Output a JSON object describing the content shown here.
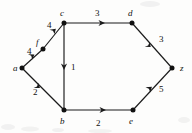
{
  "figure": {
    "kind": "directed-weighted-graph",
    "background_color": "#fdfdfc",
    "ink_color": "#1a1a1a"
  },
  "nodes": [
    {
      "id": "a",
      "label": "a",
      "x": 22,
      "y": 68,
      "label_x": 13,
      "label_y": 71
    },
    {
      "id": "f",
      "label": "f",
      "x": 43,
      "y": 49,
      "label_x": 36,
      "label_y": 45
    },
    {
      "id": "c",
      "label": "c",
      "x": 64,
      "y": 23,
      "label_x": 60,
      "label_y": 16
    },
    {
      "id": "b",
      "label": "b",
      "x": 64,
      "y": 110,
      "label_x": 60,
      "label_y": 124
    },
    {
      "id": "d",
      "label": "d",
      "x": 132,
      "y": 23,
      "label_x": 128,
      "label_y": 16
    },
    {
      "id": "e",
      "label": "e",
      "x": 133,
      "y": 110,
      "label_x": 129,
      "label_y": 124
    },
    {
      "id": "z",
      "label": "z",
      "x": 172,
      "y": 68,
      "label_x": 180,
      "label_y": 71
    }
  ],
  "edges": [
    {
      "id": "a-f",
      "from": "a",
      "to": "f",
      "weight": "4",
      "label_x": 27,
      "label_y": 54
    },
    {
      "id": "f-c",
      "from": "f",
      "to": "c",
      "weight": "4",
      "label_x": 47,
      "label_y": 28
    },
    {
      "id": "a-b",
      "from": "a",
      "to": "b",
      "weight": "2",
      "label_x": 33,
      "label_y": 95
    },
    {
      "id": "c-b",
      "from": "c",
      "to": "b",
      "weight": "1",
      "label_x": 71,
      "label_y": 70
    },
    {
      "id": "c-d",
      "from": "c",
      "to": "d",
      "weight": "3",
      "label_x": 95,
      "label_y": 16
    },
    {
      "id": "b-e",
      "from": "b",
      "to": "e",
      "weight": "2",
      "label_x": 96,
      "label_y": 126
    },
    {
      "id": "d-z",
      "from": "d",
      "to": "z",
      "weight": "3",
      "label_x": 159,
      "label_y": 42
    },
    {
      "id": "e-z",
      "from": "e",
      "to": "z",
      "weight": "5",
      "label_x": 159,
      "label_y": 92
    }
  ]
}
